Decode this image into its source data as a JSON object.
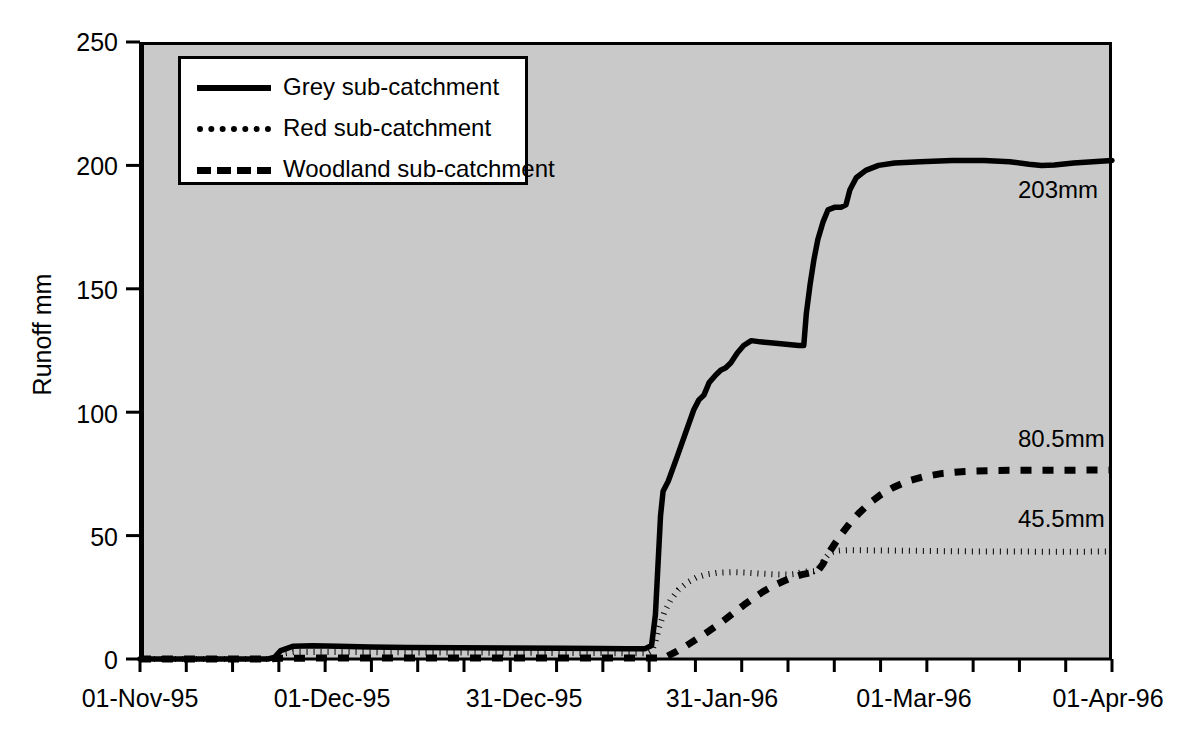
{
  "chart_data": {
    "type": "line",
    "title": "",
    "xlabel": "",
    "ylabel": "Runoff mm",
    "ylim": [
      0,
      250
    ],
    "y_ticks": [
      0,
      50,
      100,
      150,
      200,
      250
    ],
    "y_tick_labels": [
      "0",
      "50",
      "100",
      "150",
      "200",
      "250"
    ],
    "x_tick_labels": [
      "01-Nov-95",
      "01-Dec-95",
      "31-Dec-95",
      "31-Jan-96",
      "01-Mar-96",
      "01-Apr-96"
    ],
    "x_tick_label_positions_days": [
      0,
      30,
      60,
      91,
      121,
      152
    ],
    "x_minor_tick_count": 21,
    "xlim_days": [
      0,
      152
    ],
    "grid": false,
    "legend_position": "upper-left-inside",
    "plot_background": "#c9c9c9",
    "line_color": "#000000",
    "series": [
      {
        "name": "Grey sub-catchment",
        "style": "solid",
        "end_label": "203mm",
        "end_value": 203,
        "points": [
          [
            0,
            0
          ],
          [
            20,
            0
          ],
          [
            21,
            0.6
          ],
          [
            22,
            3.4
          ],
          [
            24,
            5.2
          ],
          [
            27,
            5.4
          ],
          [
            31,
            5.2
          ],
          [
            36,
            4.9
          ],
          [
            42,
            4.7
          ],
          [
            50,
            4.6
          ],
          [
            58,
            4.5
          ],
          [
            66,
            4.4
          ],
          [
            72,
            4.3
          ],
          [
            76,
            4.2
          ],
          [
            79,
            4.2
          ],
          [
            80,
            5.5
          ],
          [
            80.6,
            18
          ],
          [
            81,
            38
          ],
          [
            81.4,
            58
          ],
          [
            81.8,
            68
          ],
          [
            82.6,
            72
          ],
          [
            84,
            82
          ],
          [
            85.5,
            93
          ],
          [
            86.6,
            101
          ],
          [
            87.4,
            105
          ],
          [
            88.2,
            107
          ],
          [
            89,
            112
          ],
          [
            90,
            115
          ],
          [
            90.8,
            117
          ],
          [
            91.6,
            118
          ],
          [
            92.4,
            120
          ],
          [
            93.4,
            124
          ],
          [
            94.4,
            127
          ],
          [
            95.6,
            129
          ],
          [
            97,
            128.5
          ],
          [
            99,
            128
          ],
          [
            101,
            127.5
          ],
          [
            103,
            127
          ],
          [
            103.8,
            127
          ],
          [
            104.2,
            140
          ],
          [
            104.8,
            152
          ],
          [
            105.4,
            162
          ],
          [
            106,
            170
          ],
          [
            106.8,
            177
          ],
          [
            107.6,
            182
          ],
          [
            108.6,
            183
          ],
          [
            109.6,
            183
          ],
          [
            110.4,
            184
          ],
          [
            111,
            190
          ],
          [
            112,
            195
          ],
          [
            113.5,
            198
          ],
          [
            115.5,
            200
          ],
          [
            118,
            201
          ],
          [
            122,
            201.5
          ],
          [
            127,
            202
          ],
          [
            132,
            202
          ],
          [
            136,
            201.5
          ],
          [
            139,
            200.5
          ],
          [
            141,
            200
          ],
          [
            143,
            200.2
          ],
          [
            146,
            201
          ],
          [
            149,
            201.5
          ],
          [
            152,
            202
          ]
        ]
      },
      {
        "name": "Red sub-catchment",
        "style": "dotted",
        "end_label": "45.5mm",
        "end_value": 45.5,
        "points": [
          [
            0,
            0
          ],
          [
            20,
            0
          ],
          [
            21,
            0.3
          ],
          [
            22,
            2.0
          ],
          [
            24,
            2.8
          ],
          [
            28,
            2.9
          ],
          [
            34,
            2.8
          ],
          [
            42,
            2.7
          ],
          [
            52,
            2.6
          ],
          [
            62,
            2.5
          ],
          [
            72,
            2.4
          ],
          [
            78,
            2.3
          ],
          [
            79.5,
            2.3
          ],
          [
            80,
            3.0
          ],
          [
            80.6,
            7
          ],
          [
            81.2,
            13
          ],
          [
            82,
            19
          ],
          [
            83,
            24
          ],
          [
            84.2,
            28
          ],
          [
            85.6,
            31
          ],
          [
            87,
            33
          ],
          [
            88.6,
            34.3
          ],
          [
            90.4,
            35
          ],
          [
            92.4,
            35.2
          ],
          [
            94.6,
            35.0
          ],
          [
            97,
            34.6
          ],
          [
            99.4,
            34.3
          ],
          [
            101.4,
            34.2
          ],
          [
            102.6,
            34.5
          ],
          [
            103.4,
            35.2
          ],
          [
            104.4,
            35.5
          ],
          [
            105.4,
            35.6
          ],
          [
            106,
            36.3
          ],
          [
            106.6,
            38.5
          ],
          [
            107.2,
            41
          ],
          [
            107.8,
            42.8
          ],
          [
            108.6,
            43.7
          ],
          [
            109.6,
            44.0
          ],
          [
            111,
            44.1
          ],
          [
            115,
            44.0
          ],
          [
            122,
            43.8
          ],
          [
            130,
            43.6
          ],
          [
            140,
            43.5
          ],
          [
            148,
            43.5
          ],
          [
            152,
            43.6
          ]
        ]
      },
      {
        "name": "Woodland sub-catchment",
        "style": "dashed",
        "end_label": "80.5mm",
        "end_value": 80.5,
        "points": [
          [
            0,
            0
          ],
          [
            20,
            0
          ],
          [
            22,
            0.3
          ],
          [
            30,
            0.4
          ],
          [
            40,
            0.4
          ],
          [
            50,
            0.4
          ],
          [
            60,
            0.4
          ],
          [
            70,
            0.4
          ],
          [
            78,
            0.4
          ],
          [
            80,
            0.4
          ],
          [
            81.5,
            0.4
          ],
          [
            82.5,
            1.2
          ],
          [
            84,
            3.2
          ],
          [
            85.5,
            5.5
          ],
          [
            87,
            8.0
          ],
          [
            88.5,
            10.5
          ],
          [
            90,
            13.2
          ],
          [
            91.5,
            16.0
          ],
          [
            93,
            19.0
          ],
          [
            94.5,
            22.0
          ],
          [
            96,
            24.8
          ],
          [
            97.5,
            27.4
          ],
          [
            99,
            29.6
          ],
          [
            100.5,
            31.4
          ],
          [
            102,
            33.0
          ],
          [
            103.5,
            34.2
          ],
          [
            105,
            35.0
          ],
          [
            106,
            35.6
          ],
          [
            106.8,
            38.5
          ],
          [
            107.6,
            42.5
          ],
          [
            108.6,
            46.5
          ],
          [
            109.8,
            51
          ],
          [
            111,
            55
          ],
          [
            112.4,
            59
          ],
          [
            114,
            63
          ],
          [
            115.8,
            66.5
          ],
          [
            117.8,
            69.5
          ],
          [
            120,
            72
          ],
          [
            122.5,
            73.8
          ],
          [
            125.5,
            75.2
          ],
          [
            129,
            76.0
          ],
          [
            134,
            76.4
          ],
          [
            140,
            76.5
          ],
          [
            146,
            76.5
          ],
          [
            152,
            76.6
          ]
        ]
      }
    ]
  },
  "axes": {
    "y_title": "Runoff mm"
  }
}
